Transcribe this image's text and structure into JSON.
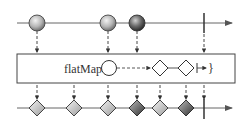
{
  "diagram": {
    "type": "marble-diagram",
    "operator": {
      "label": "flatMap{",
      "closing_brace": "}"
    },
    "input_stream": {
      "marbles": [
        {
          "shape": "circle",
          "x": 37,
          "shade": "light"
        },
        {
          "shape": "circle",
          "x": 108,
          "shade": "light"
        },
        {
          "shape": "circle",
          "x": 137,
          "shade": "dark"
        }
      ],
      "completion_x": 204
    },
    "operator_box": {
      "inner_marbles": [
        {
          "shape": "circle",
          "x": 109,
          "shade": "white"
        },
        {
          "shape": "diamond",
          "x": 160,
          "shade": "white"
        },
        {
          "shape": "diamond",
          "x": 186,
          "shade": "white"
        }
      ],
      "inner_completion_x": 197
    },
    "output_stream": {
      "marbles": [
        {
          "shape": "diamond",
          "x": 37,
          "shade": "light"
        },
        {
          "shape": "diamond",
          "x": 74,
          "shade": "light"
        },
        {
          "shape": "diamond",
          "x": 108,
          "shade": "light"
        },
        {
          "shape": "diamond",
          "x": 137,
          "shade": "dark"
        },
        {
          "shape": "diamond",
          "x": 160,
          "shade": "light"
        },
        {
          "shape": "diamond",
          "x": 186,
          "shade": "dark"
        }
      ],
      "completion_x": 204
    },
    "colors": {
      "line": "#555555",
      "light_marble": "#b8b8b8",
      "dark_marble": "#555555",
      "box_border": "#444444"
    }
  }
}
